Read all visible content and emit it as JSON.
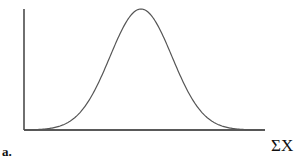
{
  "chart_data": {
    "type": "line",
    "title": "",
    "panel_label": "a.",
    "xlabel": "ΣX",
    "ylabel": "",
    "x": [
      -4,
      -3.5,
      -3,
      -2.5,
      -2,
      -1.5,
      -1,
      -0.5,
      0,
      0.5,
      1,
      1.5,
      2,
      2.5,
      3,
      3.5,
      4
    ],
    "series": [
      {
        "name": "density",
        "values": [
          0.0,
          0.002,
          0.011,
          0.044,
          0.135,
          0.325,
          0.607,
          0.882,
          1.0,
          0.882,
          0.607,
          0.325,
          0.135,
          0.044,
          0.011,
          0.002,
          0.0
        ]
      }
    ],
    "grid": false,
    "ticks": false,
    "legend": null
  },
  "labels": {
    "panel": "a.",
    "x_axis": "ΣX"
  },
  "colors": {
    "curve": "#555555",
    "axis": "#222222"
  }
}
